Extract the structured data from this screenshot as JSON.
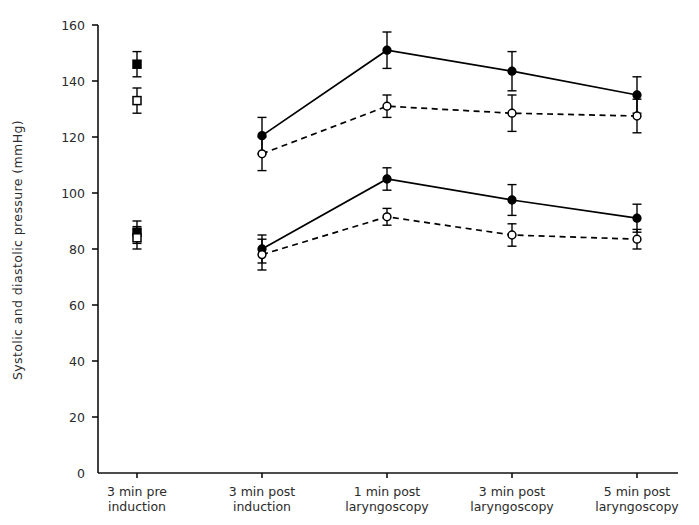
{
  "chart_data": {
    "type": "line",
    "title": "",
    "xlabel": "",
    "ylabel": "Systolic and diastolic pressure (mmHg)",
    "ylim": [
      0,
      160
    ],
    "ytick_values": [
      0,
      20,
      40,
      60,
      80,
      100,
      120,
      140,
      160
    ],
    "ytick_labels": [
      "0",
      "20",
      "40",
      "60",
      "80",
      "100",
      "120",
      "140",
      "160"
    ],
    "grid": false,
    "legend_position": "none",
    "categories": [
      "3 min pre\ninduction",
      "3 min post\ninduction",
      "1 min post\nlaryngoscopy",
      "3 min post\nlaryngoscopy",
      "5 min post\nlaryngoscopy"
    ],
    "category_lines": [
      [
        "3 min pre",
        "induction"
      ],
      [
        "3 min post",
        "induction"
      ],
      [
        "1 min post",
        "laryngoscopy"
      ],
      [
        "3 min post",
        "laryngoscopy"
      ],
      [
        "5 min post",
        "laryngoscopy"
      ]
    ],
    "series": [
      {
        "name": "Systolic pressure - group A",
        "marker": "filled-square-circle",
        "line": "solid",
        "color": "#000000",
        "values": [
          146,
          120.5,
          151,
          143.5,
          135
        ],
        "errors": [
          4.5,
          6.5,
          6.5,
          7.0,
          6.5
        ],
        "connected_from_index": 1
      },
      {
        "name": "Systolic pressure - group B",
        "marker": "open-square-circle",
        "line": "dashed",
        "color": "#000000",
        "values": [
          133,
          114,
          131,
          128.5,
          127.5
        ],
        "errors": [
          4.5,
          6.0,
          4.0,
          6.5,
          6.0
        ],
        "connected_from_index": 1
      },
      {
        "name": "Diastolic pressure - group A",
        "marker": "filled-square-circle",
        "line": "solid",
        "color": "#000000",
        "values": [
          86,
          80,
          105,
          97.5,
          91
        ],
        "errors": [
          4.0,
          5.0,
          4.0,
          5.5,
          5.0
        ],
        "connected_from_index": 1
      },
      {
        "name": "Diastolic pressure - group B",
        "marker": "open-square-circle",
        "line": "dashed",
        "color": "#000000",
        "values": [
          84,
          78,
          91.5,
          85,
          83.5
        ],
        "errors": [
          4.0,
          5.5,
          3.0,
          4.0,
          3.5
        ],
        "connected_from_index": 1
      }
    ]
  },
  "axis": {
    "y_title": "Systolic and diastolic pressure (mmHg)"
  }
}
